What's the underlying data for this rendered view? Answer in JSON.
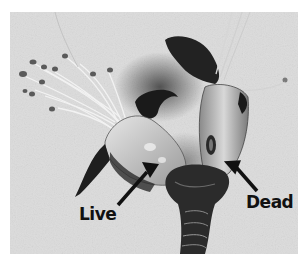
{
  "image": {
    "description": "Grayscale photograph of two dissected flower buds on a textured white background, one with live green-pale tissue and one with a darkened dead pistil",
    "colors": {
      "background_border": "#ffffff",
      "paper": "#dcdcdc",
      "tissue_light": "#cfcfcf",
      "tissue_dark": "#1e1e1e",
      "arrow": "#111111",
      "text": "#111111"
    }
  },
  "annotations": [
    {
      "text": "Live",
      "arrow": "arrow-up-right"
    },
    {
      "text": "Dead",
      "arrow": "arrow-up-left"
    }
  ]
}
